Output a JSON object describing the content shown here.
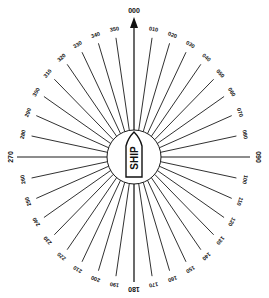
{
  "diagram": {
    "center": {
      "x": 134,
      "y": 157
    },
    "inner_circle_radius": 27,
    "spoke_radius": {
      "rx": 104,
      "ry": 121
    },
    "label_radius": {
      "rx": 113,
      "ry": 130
    },
    "line_color": "#1a1a1a",
    "ship_label": "SHIP",
    "cardinal": [
      {
        "bearing": 0,
        "label": "000"
      },
      {
        "bearing": 90,
        "label": "090"
      },
      {
        "bearing": 180,
        "label": "180"
      },
      {
        "bearing": 270,
        "label": "270"
      }
    ],
    "bearings": [
      {
        "bearing": 10,
        "label": "010"
      },
      {
        "bearing": 20,
        "label": "020"
      },
      {
        "bearing": 30,
        "label": "030"
      },
      {
        "bearing": 40,
        "label": "040"
      },
      {
        "bearing": 50,
        "label": "050"
      },
      {
        "bearing": 60,
        "label": "060"
      },
      {
        "bearing": 70,
        "label": "070"
      },
      {
        "bearing": 80,
        "label": "080"
      },
      {
        "bearing": 100,
        "label": "100"
      },
      {
        "bearing": 110,
        "label": "110"
      },
      {
        "bearing": 120,
        "label": "120"
      },
      {
        "bearing": 130,
        "label": "130"
      },
      {
        "bearing": 140,
        "label": "140"
      },
      {
        "bearing": 150,
        "label": "150"
      },
      {
        "bearing": 160,
        "label": "160"
      },
      {
        "bearing": 170,
        "label": "170"
      },
      {
        "bearing": 190,
        "label": "190"
      },
      {
        "bearing": 200,
        "label": "200"
      },
      {
        "bearing": 210,
        "label": "210"
      },
      {
        "bearing": 220,
        "label": "220"
      },
      {
        "bearing": 230,
        "label": "230"
      },
      {
        "bearing": 240,
        "label": "240"
      },
      {
        "bearing": 250,
        "label": "250"
      },
      {
        "bearing": 260,
        "label": "260"
      },
      {
        "bearing": 280,
        "label": "280"
      },
      {
        "bearing": 290,
        "label": "290"
      },
      {
        "bearing": 300,
        "label": "300"
      },
      {
        "bearing": 310,
        "label": "310"
      },
      {
        "bearing": 320,
        "label": "320"
      },
      {
        "bearing": 330,
        "label": "330"
      },
      {
        "bearing": 340,
        "label": "340"
      },
      {
        "bearing": 350,
        "label": "350"
      }
    ]
  }
}
